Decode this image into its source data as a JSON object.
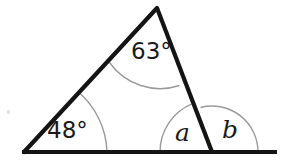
{
  "figure": {
    "kind": "geometry-diagram",
    "width": 288,
    "height": 168,
    "background_color": "#ffffff",
    "stroke_color": "#141414",
    "arc_color": "#9a9a9a",
    "label_color": "#1a1a1a"
  },
  "labels": {
    "apex_angle": "63°",
    "left_angle": "48°",
    "angle_a": "a",
    "angle_b": "b"
  },
  "geometry": {
    "points": {
      "apex": {
        "x": 157,
        "y": 8
      },
      "left_vertex": {
        "x": 24,
        "y": 152
      },
      "right_vertex": {
        "x": 212,
        "y": 152
      },
      "baseline_left_end": {
        "x": 22,
        "y": 152
      },
      "baseline_right_end": {
        "x": 277,
        "y": 152
      }
    },
    "arcs": {
      "apex_arc_radius": 62,
      "left_arc_radius": 83,
      "angle_a_arc_radius": 52,
      "angle_b_arc_radius": 46
    },
    "stroke_widths": {
      "triangle": 4.2,
      "baseline": 4.2,
      "arc": 1.4
    }
  }
}
